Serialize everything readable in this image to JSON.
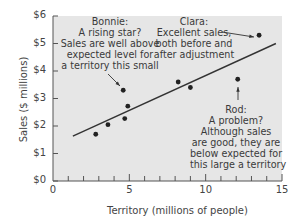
{
  "chart_data": {
    "type": "scatter",
    "title": "",
    "xlabel": "Territory (millions of people)",
    "ylabel": "Sales ($ millions)",
    "xlim": [
      0,
      15
    ],
    "ylim": [
      0,
      6
    ],
    "x_ticks": [
      "0",
      "5",
      "10",
      "15"
    ],
    "y_ticks": [
      "$0",
      "$1",
      "$2",
      "$3",
      "$4",
      "$5",
      "$6"
    ],
    "grid": false,
    "background": "#e6e6e6",
    "points": [
      {
        "x": 2.8,
        "y": 1.7
      },
      {
        "x": 3.6,
        "y": 2.05
      },
      {
        "x": 4.7,
        "y": 2.27
      },
      {
        "x": 4.9,
        "y": 2.72
      },
      {
        "x": 4.6,
        "y": 3.3,
        "label": "Bonnie"
      },
      {
        "x": 8.2,
        "y": 3.6
      },
      {
        "x": 9.0,
        "y": 3.4
      },
      {
        "x": 12.1,
        "y": 3.7,
        "label": "Rod"
      },
      {
        "x": 13.5,
        "y": 5.3,
        "label": "Clara"
      }
    ],
    "trend_line": {
      "x": [
        1.3,
        14.6
      ],
      "y": [
        1.63,
        5.0
      ]
    },
    "annotations": [
      {
        "name": "Bonnie",
        "lines": [
          "Bonnie:",
          "A rising star?",
          "Sales are well above",
          "expected level for",
          "a territory this small"
        ]
      },
      {
        "name": "Clara",
        "lines": [
          "Clara:",
          "Excellent sales,",
          "both before and",
          "after adjustment"
        ]
      },
      {
        "name": "Rod",
        "lines": [
          "Rod:",
          "A problem?",
          "Although sales",
          "are good, they are",
          "below expected for",
          "this large a territory"
        ]
      }
    ]
  }
}
